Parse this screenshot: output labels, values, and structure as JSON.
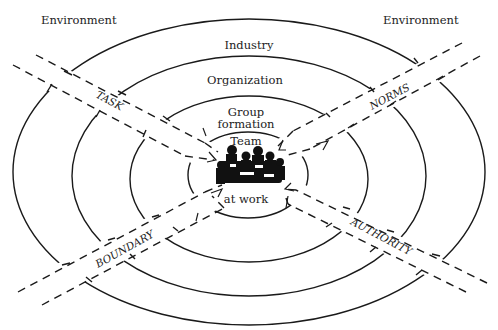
{
  "diagram": {
    "type": "concentric-ellipses-with-boundary-bands",
    "rings": [
      {
        "id": "environment",
        "label": "Environment"
      },
      {
        "id": "industry",
        "label": "Industry"
      },
      {
        "id": "organization",
        "label": "Organization"
      },
      {
        "id": "group",
        "label_line1": "Group",
        "label_line2": "formation"
      },
      {
        "id": "team",
        "label_top": "Team",
        "label_bottom": "at work"
      }
    ],
    "corner_labels": {
      "top_left": "Environment",
      "top_right": "Environment"
    },
    "bands": [
      {
        "id": "task",
        "label": "TASK",
        "position": "upper-left"
      },
      {
        "id": "norms",
        "label": "NORMS",
        "position": "upper-right"
      },
      {
        "id": "boundary",
        "label": "BOUNDARY",
        "position": "lower-left"
      },
      {
        "id": "authority",
        "label": "AUTHORITY",
        "position": "lower-right"
      }
    ],
    "center_image": "team-meeting-illustration",
    "colors": {
      "line": "#1a1a1a",
      "background": "#ffffff"
    }
  }
}
